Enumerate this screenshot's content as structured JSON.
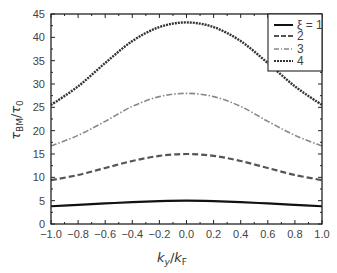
{
  "chart_data": {
    "type": "line",
    "title": "",
    "xlabel": "k_y/k_F",
    "ylabel": "τ_BM/τ_0",
    "xlim": [
      -1.0,
      1.0
    ],
    "ylim": [
      0,
      45
    ],
    "grid": false,
    "legend_position": "top-right",
    "x_ticks": [
      "-1.0",
      "-0.8",
      "-0.6",
      "-0.4",
      "-0.2",
      "0.0",
      "0.2",
      "0.4",
      "0.6",
      "0.8",
      "1.0"
    ],
    "y_ticks": [
      "0",
      "5",
      "10",
      "15",
      "20",
      "25",
      "30",
      "35",
      "40",
      "45"
    ],
    "x": [
      -1.0,
      -0.8,
      -0.6,
      -0.4,
      -0.2,
      0.0,
      0.2,
      0.4,
      0.6,
      0.8,
      1.0
    ],
    "series": [
      {
        "name": "ξ=1",
        "style": "solid",
        "color": "#111111",
        "values": [
          3.8,
          4.1,
          4.4,
          4.7,
          4.9,
          5.0,
          4.9,
          4.7,
          4.4,
          4.1,
          3.8
        ]
      },
      {
        "name": "2",
        "style": "dashed",
        "color": "#555555",
        "values": [
          9.4,
          10.5,
          12.0,
          13.5,
          14.6,
          15.0,
          14.6,
          13.5,
          12.0,
          10.5,
          9.4
        ]
      },
      {
        "name": "3",
        "style": "dash-dot",
        "color": "#888888",
        "values": [
          16.7,
          19.0,
          22.0,
          25.2,
          27.3,
          28.0,
          27.3,
          25.2,
          22.0,
          19.0,
          16.7
        ]
      },
      {
        "name": "4",
        "style": "dotted",
        "color": "#333333",
        "values": [
          25.5,
          29.5,
          34.5,
          39.2,
          42.2,
          43.2,
          42.2,
          39.2,
          34.5,
          29.5,
          25.5
        ]
      }
    ]
  },
  "labels": {
    "xlabel_main": "k",
    "xlabel_sub1": "y",
    "xlabel_slash": "/",
    "xlabel_main2": "k",
    "xlabel_sub2": "F",
    "ylabel_main": "τ",
    "ylabel_sub1": "BM",
    "ylabel_slash": "/",
    "ylabel_main2": "τ",
    "ylabel_sub2": "0"
  },
  "legend": {
    "items": [
      "ξ = 1",
      "2",
      "3",
      "4"
    ]
  }
}
